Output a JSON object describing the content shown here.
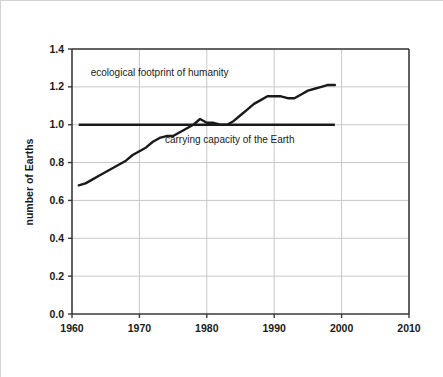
{
  "chart_data": {
    "type": "line",
    "title": "",
    "xlabel": "",
    "ylabel": "number of Earths",
    "xlim": [
      1960,
      2010
    ],
    "ylim": [
      0.0,
      1.4
    ],
    "grid": true,
    "legend_position": "none",
    "xticks": [
      "1960",
      "1970",
      "1980",
      "1990",
      "2000",
      "2010"
    ],
    "xtick_values": [
      1960,
      1970,
      1980,
      1990,
      2000,
      2010
    ],
    "yticks": [
      "0.0",
      "0.2",
      "0.4",
      "0.6",
      "0.8",
      "1.0",
      "1.2",
      "1.4"
    ],
    "ytick_values": [
      0.0,
      0.2,
      0.4,
      0.6,
      0.8,
      1.0,
      1.2,
      1.4
    ],
    "series": [
      {
        "name": "ecological footprint of humanity",
        "color": "#1a1a1a",
        "x": [
          1961,
          1962,
          1963,
          1964,
          1965,
          1966,
          1967,
          1968,
          1969,
          1970,
          1971,
          1972,
          1973,
          1974,
          1975,
          1976,
          1977,
          1978,
          1979,
          1980,
          1981,
          1982,
          1983,
          1984,
          1985,
          1986,
          1987,
          1988,
          1989,
          1990,
          1991,
          1992,
          1993,
          1994,
          1995,
          1996,
          1997,
          1998,
          1999
        ],
        "values": [
          0.68,
          0.69,
          0.71,
          0.73,
          0.75,
          0.77,
          0.79,
          0.81,
          0.84,
          0.86,
          0.88,
          0.91,
          0.93,
          0.94,
          0.94,
          0.96,
          0.98,
          1.0,
          1.03,
          1.01,
          1.01,
          1.0,
          1.0,
          1.02,
          1.05,
          1.08,
          1.11,
          1.13,
          1.15,
          1.15,
          1.15,
          1.14,
          1.14,
          1.16,
          1.18,
          1.19,
          1.2,
          1.21,
          1.21
        ]
      },
      {
        "name": "carrying capacity of the Earth",
        "color": "#1a1a1a",
        "x": [
          1961,
          1999
        ],
        "values": [
          1.0,
          1.0
        ]
      }
    ],
    "annotations": [
      {
        "name": "footprint-label",
        "text": "ecological footprint of humanity",
        "x": 1973.0,
        "y": 1.255
      },
      {
        "name": "carrying-capacity-label",
        "text": "carrying capacity of the Earth",
        "x": 1983.4,
        "y": 0.905
      }
    ],
    "colors": {
      "series_line": "#1a1a1a",
      "axis": "#3a3a3a",
      "grid": "#c8c8c8",
      "background": "#ffffff",
      "border": "#d3d3d3",
      "text": "#1a1a1a"
    }
  }
}
